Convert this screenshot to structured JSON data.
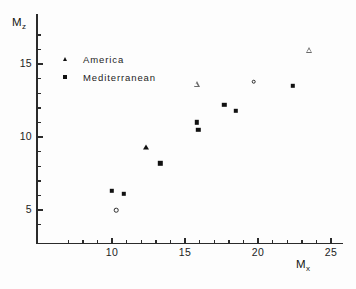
{
  "axes": {
    "y_title_main": "M",
    "y_title_sub": "z",
    "x_title_main": "M",
    "x_title_sub": "x",
    "y_ticks": [
      "5",
      "10",
      "15"
    ],
    "x_ticks": [
      "10",
      "15",
      "20",
      "25"
    ]
  },
  "legend": {
    "entries": [
      {
        "label": "America",
        "marker": "filled-triangle"
      },
      {
        "label": "Mediterranean",
        "marker": "filled-square"
      }
    ]
  },
  "chart_data": {
    "type": "scatter",
    "title": "",
    "xlabel": "Mx",
    "ylabel": "Mz",
    "xlim": [
      6.2,
      25.8
    ],
    "ylim": [
      3.2,
      17.5
    ],
    "grid": false,
    "legend_position": "upper-left-inside",
    "x_ticks": [
      10,
      15,
      20,
      25
    ],
    "y_ticks": [
      5,
      10,
      15
    ],
    "x_minor_tick_step": 1,
    "y_minor_tick_step": 1,
    "series": [
      {
        "name": "America",
        "marker": "filled-triangle",
        "points": [
          {
            "x": 12.3,
            "y": 9.3
          }
        ]
      },
      {
        "name": "Mediterranean",
        "marker": "filled-square",
        "points": [
          {
            "x": 10.0,
            "y": 6.3
          },
          {
            "x": 10.8,
            "y": 6.1
          },
          {
            "x": 13.3,
            "y": 8.2
          },
          {
            "x": 15.8,
            "y": 11.0
          },
          {
            "x": 15.9,
            "y": 10.5
          },
          {
            "x": 17.7,
            "y": 12.2
          },
          {
            "x": 18.5,
            "y": 11.8
          },
          {
            "x": 22.4,
            "y": 13.5
          }
        ]
      },
      {
        "name": "open-triangle-points",
        "marker": "open-triangle",
        "points": [
          {
            "x": 15.8,
            "y": 13.6
          },
          {
            "x": 23.5,
            "y": 16.4
          }
        ]
      },
      {
        "name": "open-circle-points",
        "marker": "open-circle",
        "points": [
          {
            "x": 10.3,
            "y": 5.0
          },
          {
            "x": 19.7,
            "y": 13.8
          }
        ]
      }
    ]
  }
}
